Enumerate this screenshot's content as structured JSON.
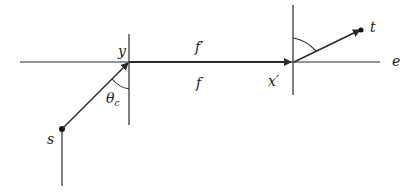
{
  "diagram": {
    "labels": {
      "y": "y",
      "f_prime": "f′",
      "f": "f",
      "x_prime": "x′",
      "t": "t",
      "e": "e",
      "theta": "θ",
      "theta_sub": "c",
      "s": "s"
    },
    "colors": {
      "line": "#2a2a2a",
      "background": "#ffffff"
    }
  }
}
